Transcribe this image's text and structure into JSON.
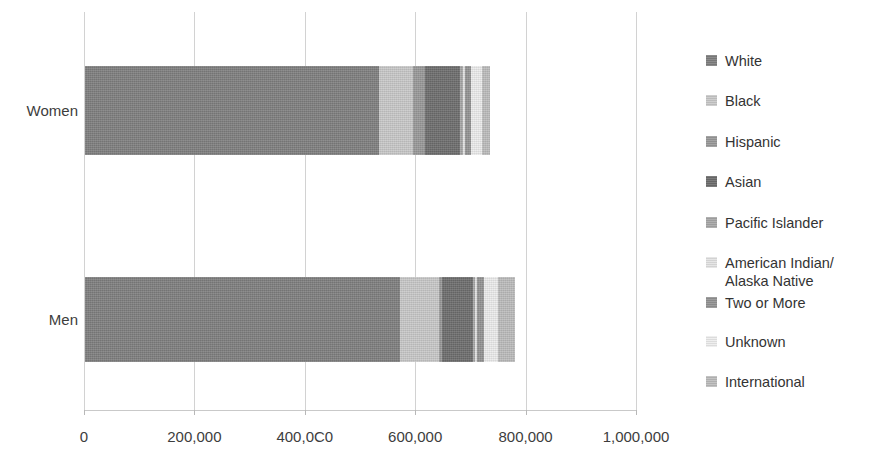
{
  "chart_data": {
    "type": "bar",
    "orientation": "horizontal",
    "stacked": true,
    "title": "",
    "xlabel": "",
    "ylabel": "",
    "categories": [
      "Women",
      "Men"
    ],
    "xlim": [
      0,
      1000000
    ],
    "xticks": [
      0,
      200000,
      400000,
      600000,
      800000,
      1000000
    ],
    "xtick_labels": [
      "0",
      "200,000",
      "400,0C0",
      "600,000",
      "800,000",
      "1,000,000"
    ],
    "grid": true,
    "legend_position": "right",
    "series": [
      {
        "name": "White",
        "color": "#808080",
        "values": [
          532000,
          570000
        ]
      },
      {
        "name": "Black",
        "color": "#c9c9c9",
        "values": [
          63000,
          71000
        ]
      },
      {
        "name": "Hispanic",
        "color": "#9a9a9a",
        "values": [
          21000,
          6000
        ]
      },
      {
        "name": "Asian",
        "color": "#6e6e6e",
        "values": [
          64000,
          55000
        ]
      },
      {
        "name": "Pacific Islander",
        "color": "#a8a8a8",
        "values": [
          5000,
          5000
        ]
      },
      {
        "name": "American Indian/\nAlaska Native",
        "color": "#e3e3e3",
        "values": [
          4000,
          4000
        ]
      },
      {
        "name": "Two or More",
        "color": "#949494",
        "values": [
          11000,
          12000
        ]
      },
      {
        "name": "Unknown",
        "color": "#ededed",
        "values": [
          20000,
          26000
        ]
      },
      {
        "name": "International",
        "color": "#bdbdbd",
        "values": [
          14000,
          30000
        ]
      }
    ]
  },
  "legend": {
    "items": [
      {
        "label": "White"
      },
      {
        "label": "Black"
      },
      {
        "label": "Hispanic"
      },
      {
        "label": "Asian"
      },
      {
        "label": "Pacific Islander"
      },
      {
        "label": "American Indian/\nAlaska Native"
      },
      {
        "label": "Two or More"
      },
      {
        "label": "Unknown"
      },
      {
        "label": "International"
      }
    ]
  }
}
